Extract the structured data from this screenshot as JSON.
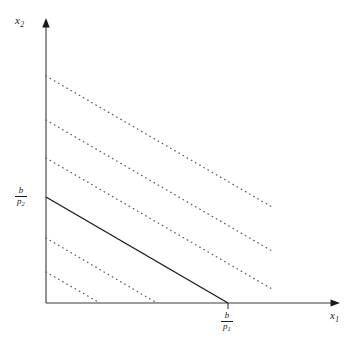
{
  "figure": {
    "background_color": "#ffffff",
    "line_color": "#1a1a1a",
    "dotted_color": "#555555",
    "width": 354,
    "height": 340
  },
  "axes": {
    "x_axis": {
      "label_text": "x",
      "label_subscript": "1",
      "origin_px": [
        46,
        303
      ],
      "arrow_end_px": [
        338,
        303
      ]
    },
    "y_axis": {
      "label_text": "x",
      "label_subscript": "2",
      "origin_px": [
        46,
        303
      ],
      "arrow_end_px": [
        46,
        20
      ]
    }
  },
  "tick_labels": {
    "y_intercept": {
      "numerator": "b",
      "denominator": "p",
      "denominator_subscript": "2"
    },
    "x_intercept": {
      "numerator": "b",
      "denominator": "p",
      "denominator_subscript": "1"
    }
  },
  "chart_data": {
    "type": "line",
    "title": "",
    "xlabel": "x1",
    "ylabel": "x2",
    "grid": false,
    "legend": "none",
    "xlim": [
      0,
      354
    ],
    "ylim": [
      0,
      340
    ],
    "slope": -0.582,
    "series": [
      {
        "name": "budget-line",
        "style": "solid",
        "x": [
          46,
          228
        ],
        "y": [
          197,
          303
        ],
        "y_intercept_label": "b/p2",
        "x_intercept_label": "b/p1"
      },
      {
        "name": "dotted-line-1",
        "style": "dotted",
        "x": [
          46,
          272
        ],
        "y": [
          76,
          207
        ]
      },
      {
        "name": "dotted-line-2",
        "style": "dotted",
        "x": [
          46,
          272
        ],
        "y": [
          120,
          251
        ]
      },
      {
        "name": "dotted-line-3",
        "style": "dotted",
        "x": [
          46,
          272
        ],
        "y": [
          158,
          289
        ]
      },
      {
        "name": "dotted-line-4",
        "style": "dotted",
        "x": [
          46,
          157
        ],
        "y": [
          238,
          303
        ]
      },
      {
        "name": "dotted-line-5",
        "style": "dotted",
        "x": [
          46,
          100
        ],
        "y": [
          272,
          303
        ]
      }
    ]
  }
}
